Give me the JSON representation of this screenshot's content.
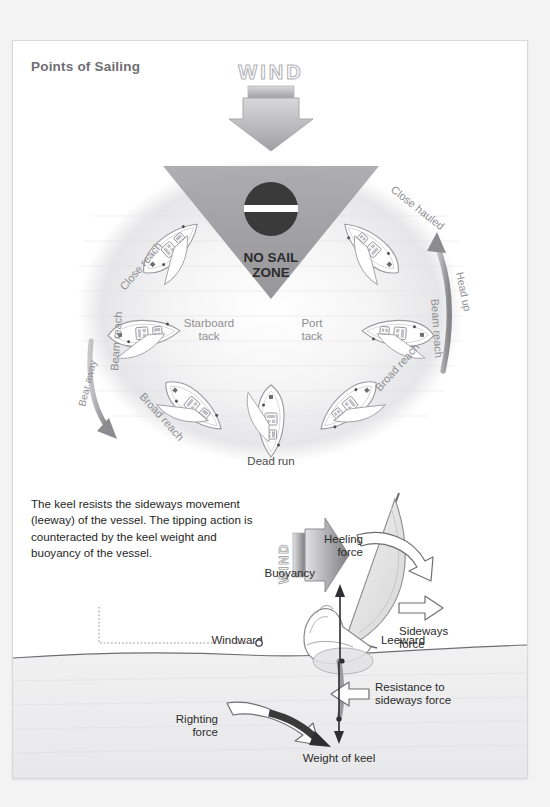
{
  "page": {
    "title": "Points of Sailing",
    "background": "#f3f3f4",
    "card_background": "#ffffff",
    "title_color": "#6e6e73"
  },
  "points_of_sailing": {
    "wind_label": "WIND",
    "no_sail_zone_line1": "NO SAIL",
    "no_sail_zone_line2": "ZONE",
    "labels": {
      "close_hauled": "Close hauled",
      "close_reach": "Close reach",
      "beam_reach_left": "Beam reach",
      "beam_reach_right": "Beam reach",
      "broad_reach_left": "Broad reach",
      "broad_reach_right": "Broad reach",
      "dead_run": "Dead run",
      "starboard_tack_line1": "Starboard",
      "starboard_tack_line2": "tack",
      "port_tack_line1": "Port",
      "port_tack_line2": "tack",
      "head_up": "Head up",
      "bear_away": "Bear away"
    },
    "colors": {
      "zone_fill": "#9b9b9e",
      "circle_fill": "#efefef",
      "label_gray": "#8e8e92",
      "arrow_gray": "#9a9a9d"
    }
  },
  "keel_section": {
    "paragraph": "The keel resists the sideways movement (leeway) of the vessel. The tipping action is counteracted by the keel weight and buoyancy of the vessel.",
    "wind_label": "WIND",
    "labels": {
      "heeling_force_line1": "Heeling",
      "heeling_force_line2": "force",
      "buoyancy": "Buoyancy",
      "sideways_force_line1": "Sideways",
      "sideways_force_line2": "force",
      "windward": "Windward",
      "leeward": "Leeward",
      "resistance_line1": "Resistance to",
      "resistance_line2": "sideways force",
      "righting_force_line1": "Righting",
      "righting_force_line2": "force",
      "weight_of_keel": "Weight of keel"
    },
    "colors": {
      "sail_fill": "#e3e3e3",
      "water_fill": "#ededee",
      "arrow_dark": "#3a3a3a",
      "text": "#1f1f1f"
    }
  }
}
